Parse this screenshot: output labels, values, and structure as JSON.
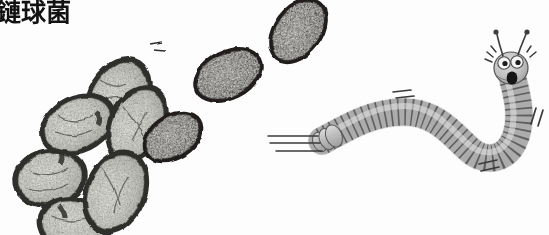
{
  "figure": {
    "caption_text": "鏈球菌",
    "caption_visible_note": "leading character cropped at left edge",
    "background_color": "#fdfdfd",
    "width": 549,
    "height": 235
  },
  "colors": {
    "ink_dark": "#2b2b2b",
    "ink_outline": "#1a1a1a",
    "bacteria_light_fill": "#d9d9d4",
    "bacteria_light_rim": "#3a3a38",
    "bacteria_dark_fill": "#55524f",
    "bacteria_dark_rim": "#232220",
    "worm_fill": "#b7b7b7",
    "worm_fill_light": "#cfcfcf",
    "worm_outline": "#4d4d4d",
    "worm_head_fill": "#c8c8c8",
    "eye_white": "#f2f2f2",
    "pupil": "#1c1c1c",
    "motion_line": "#3a3a3a",
    "caption_color": "#121212"
  },
  "bacteria_cluster_light": {
    "name": "streptococcus-chain",
    "description": "chain of light grey stained cocci with dark rims",
    "cells": [
      {
        "id": "cell-1",
        "cx": 118,
        "cy": 96,
        "rx": 40,
        "ry": 28,
        "rot": -58
      },
      {
        "id": "cell-2",
        "cx": 78,
        "cy": 122,
        "rx": 38,
        "ry": 27,
        "rot": -28
      },
      {
        "id": "cell-3",
        "cx": 49,
        "cy": 176,
        "rx": 36,
        "ry": 28,
        "rot": -12
      },
      {
        "id": "cell-4",
        "cx": 70,
        "cy": 224,
        "rx": 36,
        "ry": 27,
        "rot": 14
      },
      {
        "id": "cell-5",
        "cx": 135,
        "cy": 121,
        "rx": 39,
        "ry": 27,
        "rot": -62
      },
      {
        "id": "cell-6",
        "cx": 115,
        "cy": 190,
        "rx": 40,
        "ry": 29,
        "rot": -66
      }
    ]
  },
  "bacteria_cluster_dark": {
    "name": "diplococcus-pair-dark",
    "description": "two darker stained ovals plus one smaller dark oval",
    "cells": [
      {
        "id": "dark-1",
        "cx": 298,
        "cy": 30,
        "rx": 35,
        "ry": 23,
        "rot": -52
      },
      {
        "id": "dark-2",
        "cx": 228,
        "cy": 74,
        "rx": 35,
        "ry": 23,
        "rot": -26
      },
      {
        "id": "dark-3",
        "cx": 172,
        "cy": 136,
        "rx": 31,
        "ry": 21,
        "rot": -32
      }
    ]
  },
  "worm": {
    "name": "cartoon-caterpillar",
    "segment_count": 40,
    "has_antennae": true,
    "antennae_count": 2,
    "eye_count": 2,
    "mouth": "open-oval",
    "motion_lines": [
      {
        "id": "tail-speed-lines",
        "count": 3,
        "orientation": "horizontal",
        "x": 268,
        "y": 140
      },
      {
        "id": "top-speed-lines",
        "count": 2,
        "orientation": "horizontal",
        "x": 393,
        "y": 93
      },
      {
        "id": "right-speed-lines",
        "count": 2,
        "orientation": "diagonal",
        "x": 531,
        "y": 118
      },
      {
        "id": "bottom-speed-lines",
        "count": 2,
        "orientation": "diagonal",
        "x": 482,
        "y": 166
      },
      {
        "id": "head-excitement-lines",
        "count": 3,
        "orientation": "radial",
        "x": 508,
        "y": 48
      }
    ]
  }
}
